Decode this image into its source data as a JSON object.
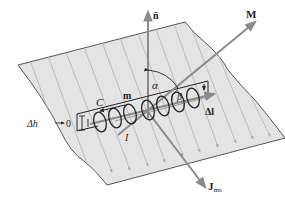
{
  "diagram": {
    "labels": {
      "normal": "n̄",
      "magnetization": "M",
      "surface_current": "J",
      "surface_current_sub": "ms",
      "contour": "C",
      "m": "m",
      "alpha": "α",
      "beta": "β",
      "current": "I",
      "delta_l": "Δl",
      "delta_h": "Δh",
      "delta_h_limit": "0"
    },
    "colors": {
      "sheet_fill": "#e4e4e4",
      "sheet_edge": "#555555",
      "hatch": "#b8b8b8",
      "vector": "#8a8a8a",
      "ink": "#222222"
    }
  }
}
